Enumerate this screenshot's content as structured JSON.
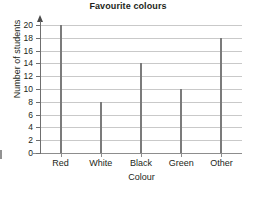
{
  "chart_data": {
    "type": "bar",
    "title": "Favourite colours",
    "xlabel": "Colour",
    "ylabel": "Number of students",
    "categories": [
      "Red",
      "White",
      "Black",
      "Green",
      "Other"
    ],
    "values": [
      20,
      8,
      14,
      10,
      18
    ],
    "ylim": [
      0,
      20
    ],
    "ytick_step": 2,
    "yticks": [
      0,
      2,
      4,
      6,
      8,
      10,
      12,
      14,
      16,
      18,
      20
    ],
    "ytick_labels": [
      "0",
      "2",
      "4",
      "6",
      "8",
      "10",
      "12",
      "14",
      "16",
      "18",
      "20"
    ],
    "grid": true,
    "grid_axis": "y",
    "legend": null,
    "legend_position": "none",
    "bar_style": "thin-line",
    "colors": {
      "bar": "#7b7b7b",
      "gridline": "#c9c9c9",
      "axis": "#6f6f6f",
      "text": "#231f20",
      "background": "#ffffff"
    }
  }
}
